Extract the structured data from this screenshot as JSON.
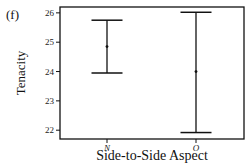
{
  "panel_label": "(f)",
  "chart_data": {
    "type": "errorbar",
    "title": "",
    "xlabel": "Side-to-Side Aspect",
    "ylabel": "Tenacity",
    "categories": [
      "N",
      "O"
    ],
    "series": [
      {
        "name": "Tenacity",
        "mean": [
          24.85,
          24.0
        ],
        "upper": [
          25.75,
          26.02
        ],
        "lower": [
          23.95,
          21.92
        ]
      }
    ],
    "ylim": [
      21.7,
      26.2
    ],
    "yticks": [
      22,
      23,
      24,
      25,
      26
    ],
    "grid": false,
    "legend": "none"
  }
}
